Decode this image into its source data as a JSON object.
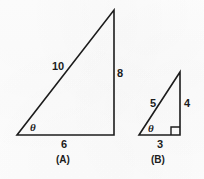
{
  "figure": {
    "background_color": "#fefefe",
    "stroke_color": "#1c1c1c",
    "text_color": "#1c1c1c"
  },
  "triangles": [
    {
      "caption": "(A)",
      "caption_x": 65,
      "caption_y": 161,
      "vertices": {
        "bottom_left": [
          17,
          135
        ],
        "bottom_right": [
          114,
          135
        ],
        "apex": [
          114,
          10
        ]
      },
      "angle": {
        "symbol": "θ",
        "x": 33,
        "y": 128,
        "vertex": "bottom_left"
      },
      "right_angle_marker": false,
      "sides": [
        {
          "name": "hypotenuse",
          "label": "10",
          "x": 59,
          "y": 67
        },
        {
          "name": "opposite",
          "label": "8",
          "x": 120,
          "y": 74
        },
        {
          "name": "adjacent",
          "label": "6",
          "x": 65,
          "y": 145
        }
      ]
    },
    {
      "caption": "(B)",
      "caption_x": 160,
      "caption_y": 161,
      "vertices": {
        "bottom_left": [
          139,
          135
        ],
        "bottom_right": [
          180,
          135
        ],
        "apex": [
          180,
          72
        ]
      },
      "angle": {
        "symbol": "θ",
        "x": 151,
        "y": 129,
        "vertex": "bottom_left"
      },
      "right_angle_marker": true,
      "right_angle_marker_size": 8,
      "sides": [
        {
          "name": "hypotenuse",
          "label": "5",
          "x": 153,
          "y": 104
        },
        {
          "name": "opposite",
          "label": "4",
          "x": 187,
          "y": 104
        },
        {
          "name": "adjacent",
          "label": "3",
          "x": 160,
          "y": 145
        }
      ]
    }
  ]
}
